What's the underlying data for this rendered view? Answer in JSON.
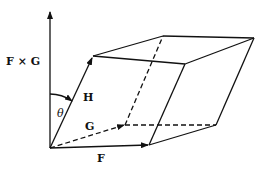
{
  "diagram": {
    "type": "parallelepiped-triple-product",
    "labels": {
      "cross": "F × G",
      "h": "H",
      "g": "G",
      "f": "F",
      "theta": "θ"
    },
    "vectors": [
      {
        "name": "F",
        "style": "solid",
        "from": [
          50,
          148
        ],
        "to": [
          149,
          145
        ]
      },
      {
        "name": "G",
        "style": "dashed",
        "from": [
          50,
          148
        ],
        "to": [
          125,
          125
        ]
      },
      {
        "name": "H",
        "style": "solid",
        "from": [
          50,
          148
        ],
        "to": [
          93,
          56
        ]
      },
      {
        "name": "F × G",
        "style": "solid",
        "from": [
          50,
          148
        ],
        "to": [
          50,
          10
        ]
      }
    ],
    "line_color": "#111111"
  }
}
